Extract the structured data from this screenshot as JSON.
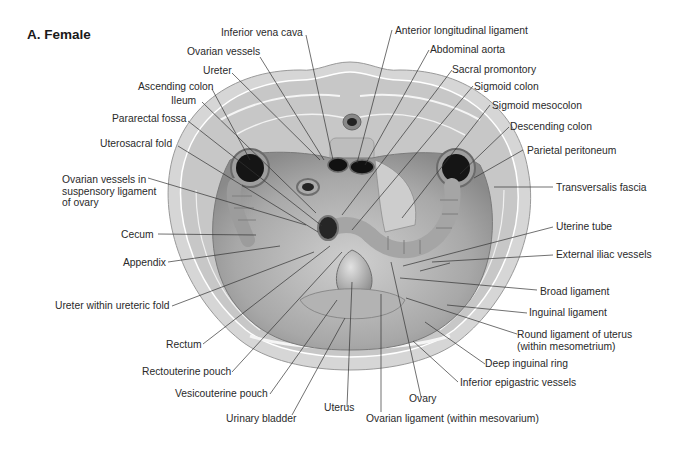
{
  "title": "A. Female",
  "colors": {
    "background": "#ffffff",
    "skin_ring": "#d2d2d2",
    "muscle": "#c4c4c4",
    "cavity": "#a9a9a9",
    "organ": "#bdbdbd",
    "lumen": "#1c1c1c",
    "leader_line": "#333333",
    "text": "#2a2a2a"
  },
  "labels": {
    "top": [
      {
        "id": "inferior-vena-cava",
        "text": "Inferior vena cava"
      },
      {
        "id": "ovarian-vessels",
        "text": "Ovarian vessels"
      },
      {
        "id": "ureter",
        "text": "Ureter"
      },
      {
        "id": "ascending-colon",
        "text": "Ascending colon"
      },
      {
        "id": "ileum",
        "text": "Ileum"
      },
      {
        "id": "pararectal-fossa",
        "text": "Pararectal fossa"
      },
      {
        "id": "uterosacral-fold",
        "text": "Uterosacral  fold"
      },
      {
        "id": "anterior-longitudinal-ligament",
        "text": "Anterior longitudinal ligament"
      },
      {
        "id": "abdominal-aorta",
        "text": "Abdominal aorta"
      },
      {
        "id": "sacral-promontory",
        "text": "Sacral promontory"
      },
      {
        "id": "sigmoid-colon",
        "text": "Sigmoid colon"
      },
      {
        "id": "sigmoid-mesocolon",
        "text": "Sigmoid mesocolon"
      },
      {
        "id": "descending-colon",
        "text": "Descending colon"
      }
    ],
    "left": [
      {
        "id": "ovarian-vessels-suspensory",
        "lines": [
          "Ovarian vessels in",
          "suspensory ligament",
          "of ovary"
        ]
      },
      {
        "id": "cecum",
        "text": "Cecum"
      },
      {
        "id": "appendix",
        "text": "Appendix"
      },
      {
        "id": "ureter-within-ureteric-fold",
        "text": "Ureter within ureteric fold"
      },
      {
        "id": "rectum",
        "text": "Rectum"
      },
      {
        "id": "rectouterine-pouch",
        "text": "Rectouterine pouch"
      },
      {
        "id": "vesicouterine-pouch",
        "text": "Vesicouterine pouch"
      },
      {
        "id": "urinary-bladder",
        "text": "Urinary bladder"
      },
      {
        "id": "uterus",
        "text": "Uterus"
      }
    ],
    "right": [
      {
        "id": "parietal-peritoneum",
        "text": "Parietal peritoneum"
      },
      {
        "id": "transversalis-fascia",
        "text": "Transversalis fascia"
      },
      {
        "id": "uterine-tube",
        "text": "Uterine tube"
      },
      {
        "id": "external-iliac-vessels",
        "text": "External iliac vessels"
      },
      {
        "id": "broad-ligament",
        "text": "Broad ligament"
      },
      {
        "id": "inguinal-ligament",
        "text": "Inguinal ligament"
      },
      {
        "id": "round-ligament",
        "lines": [
          "Round ligament of uterus",
          "(within mesometrium)"
        ]
      },
      {
        "id": "deep-inguinal-ring",
        "text": "Deep inguinal ring"
      },
      {
        "id": "inferior-epigastric-vessels",
        "text": "Inferior epigastric vessels"
      },
      {
        "id": "ovary",
        "text": "Ovary"
      },
      {
        "id": "ovarian-ligament",
        "text": "Ovarian ligament (within mesovarium)"
      }
    ]
  }
}
